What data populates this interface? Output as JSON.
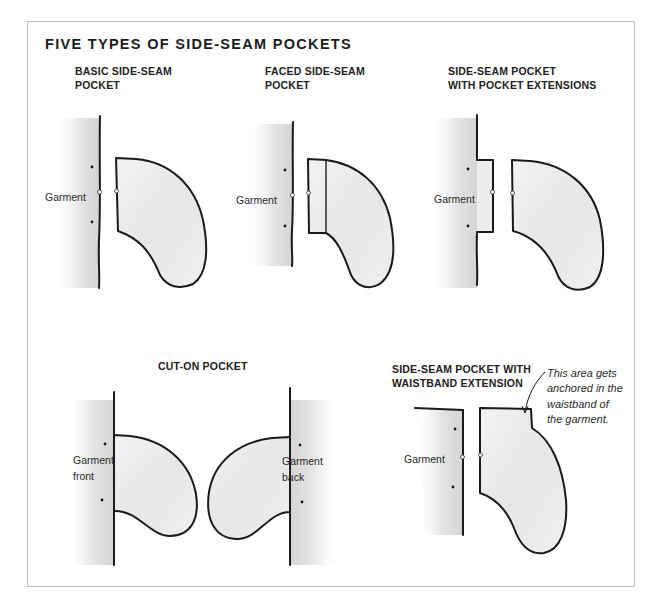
{
  "title": "FIVE TYPES OF SIDE-SEAM POCKETS",
  "panels": [
    {
      "id": "basic",
      "title_lines": [
        "BASIC SIDE-SEAM",
        "POCKET"
      ],
      "labels": [
        "Garment"
      ]
    },
    {
      "id": "faced",
      "title_lines": [
        "FACED SIDE-SEAM",
        "POCKET"
      ],
      "labels": [
        "Garment"
      ]
    },
    {
      "id": "extensions",
      "title_lines": [
        "SIDE-SEAM POCKET",
        "WITH POCKET EXTENSIONS"
      ],
      "labels": [
        "Garment"
      ]
    },
    {
      "id": "cut-on",
      "title_lines": [
        "CUT-ON POCKET"
      ],
      "labels": [
        "Garment",
        "front",
        "Garment",
        "back"
      ]
    },
    {
      "id": "waistband",
      "title_lines": [
        "SIDE-SEAM POCKET WITH",
        "WAISTBAND EXTENSION"
      ],
      "labels": [
        "Garment"
      ],
      "annotation_lines": [
        "This area gets",
        "anchored in the",
        "waistband of",
        "the garment."
      ]
    }
  ],
  "colors": {
    "outline": "#1a1a1a",
    "fabric_fill": "#efefef",
    "frame_border": "#bdbdbd",
    "shading": "#d9d9d9"
  }
}
